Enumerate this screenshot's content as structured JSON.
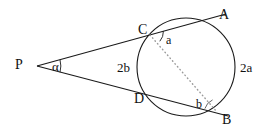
{
  "figure": {
    "background_color": "#ffffff",
    "stroke_color": "#1a1a1a",
    "dotted_color": "#8a8a8a",
    "points": {
      "P": {
        "label": "P",
        "x": 37,
        "y": 66
      },
      "A": {
        "label": "A",
        "x": 216,
        "y": 17
      },
      "B": {
        "label": "B",
        "x": 218,
        "y": 113
      },
      "C": {
        "label": "C",
        "x": 149,
        "y": 33
      },
      "D": {
        "label": "D",
        "x": 143,
        "y": 96
      }
    },
    "circle": {
      "cx": 186,
      "cy": 67,
      "r": 49
    },
    "labels": {
      "point_P": "P",
      "point_A": "A",
      "point_B": "B",
      "point_C": "C",
      "point_D": "D",
      "angle_P": "α",
      "angle_at_C": "a",
      "angle_at_B": "b",
      "arc_AB": "2a",
      "arc_CD": "2b"
    },
    "segments": [
      {
        "name": "secant-P-C-A",
        "from": "P",
        "to": "A",
        "style": "solid"
      },
      {
        "name": "secant-P-D-B",
        "from": "P",
        "to": "B",
        "style": "solid"
      },
      {
        "name": "chord-C-B",
        "from": "C",
        "to": "B",
        "style": "dotted"
      },
      {
        "name": "chord-D-B",
        "from": "D",
        "to": "B",
        "style": "solid"
      },
      {
        "name": "chord-C-A",
        "from": "C",
        "to": "A",
        "style": "solid"
      }
    ]
  }
}
